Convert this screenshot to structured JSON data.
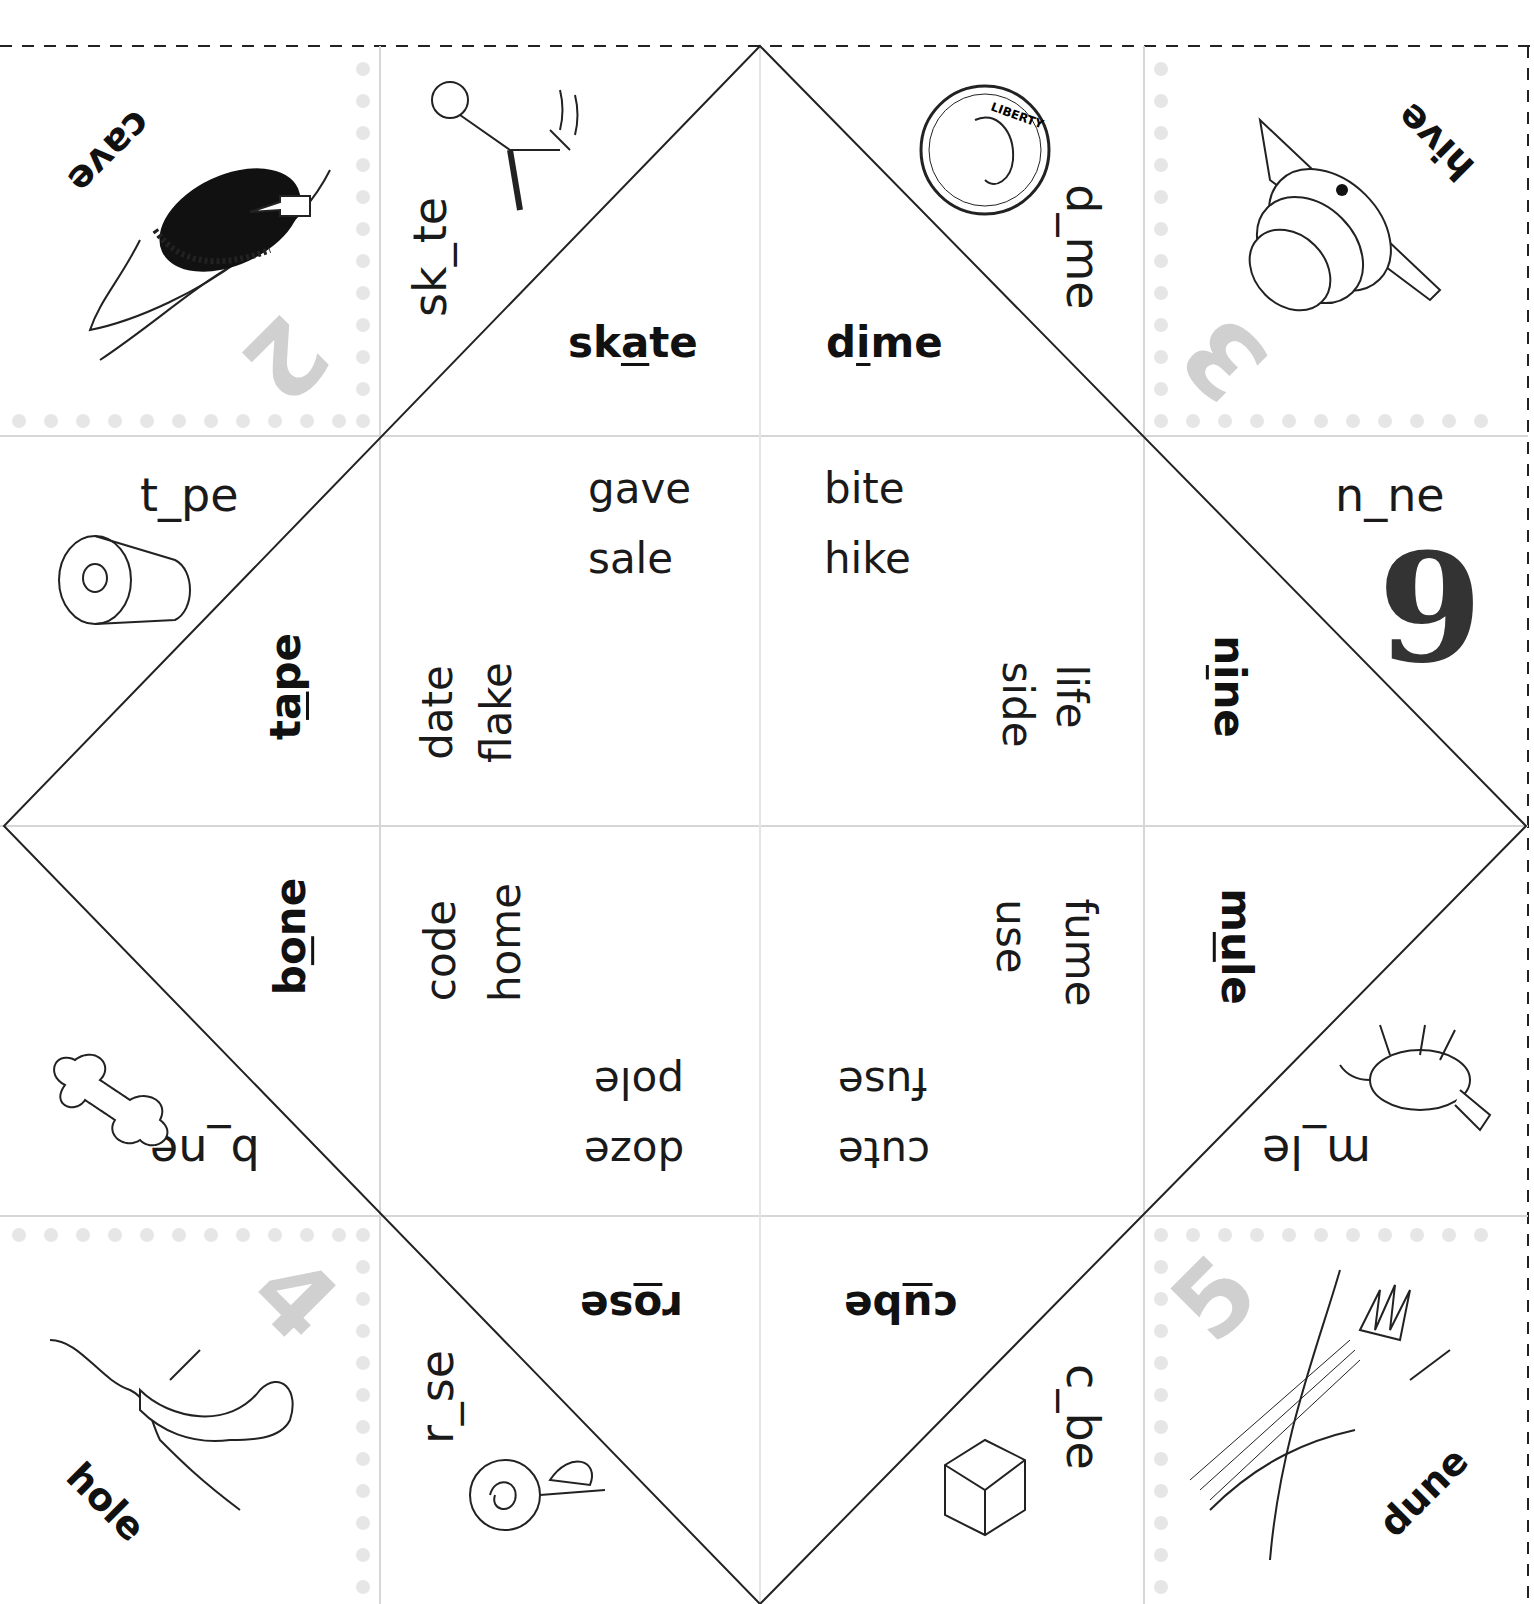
{
  "corners": [
    {
      "position": "top-left",
      "number": "2",
      "label": "cave",
      "picture": "cave-illustration"
    },
    {
      "position": "top-right",
      "number": "3",
      "label": "hive",
      "picture": "beehive-illustration"
    },
    {
      "position": "bottom-left",
      "number": "4",
      "label": "hole",
      "picture": "worm-hole-illustration"
    },
    {
      "position": "bottom-right",
      "number": "5",
      "label": "dune",
      "picture": "sand-dune-illustration"
    }
  ],
  "outer_flaps": [
    {
      "position": "top-left-upper",
      "fill": "sk_te",
      "picture": "skater-illustration"
    },
    {
      "position": "top-right-upper",
      "fill": "d_me",
      "picture": "dime-coin-illustration"
    },
    {
      "position": "left-upper",
      "fill": "t_pe",
      "picture": "tape-dispenser-illustration"
    },
    {
      "position": "right-upper",
      "fill": "n_ne",
      "picture": "number-9"
    },
    {
      "position": "left-lower",
      "fill": "b_ne",
      "picture": "bone-illustration"
    },
    {
      "position": "right-lower",
      "fill": "m_le",
      "picture": "mule-illustration"
    },
    {
      "position": "bottom-left-lower",
      "fill": "r_se",
      "picture": "rose-illustration"
    },
    {
      "position": "bottom-right-lower",
      "fill": "c_be",
      "picture": "sugar-cube-illustration"
    }
  ],
  "coin": {
    "text": "LIBERTY",
    "year": "2000",
    "motto": "IN GOD WE TRUST"
  },
  "nine_digit": "9",
  "answer_words": [
    {
      "word": "skate",
      "vowel": "a",
      "prefix": "sk",
      "suffix": "te"
    },
    {
      "word": "dime",
      "vowel": "i",
      "prefix": "d",
      "suffix": "me"
    },
    {
      "word": "tape",
      "vowel": "a",
      "prefix": "t",
      "suffix": "pe"
    },
    {
      "word": "nine",
      "vowel": "i",
      "prefix": "n",
      "suffix": "ne"
    },
    {
      "word": "bone",
      "vowel": "o",
      "prefix": "b",
      "suffix": "ne"
    },
    {
      "word": "mule",
      "vowel": "u",
      "prefix": "m",
      "suffix": "le"
    },
    {
      "word": "rose",
      "vowel": "o",
      "prefix": "r",
      "suffix": "se"
    },
    {
      "word": "cube",
      "vowel": "u",
      "prefix": "c",
      "suffix": "be"
    }
  ],
  "inner_words": {
    "top_left": [
      "gave",
      "sale"
    ],
    "top_right": [
      "bite",
      "hike"
    ],
    "left_upper": [
      "date",
      "flake"
    ],
    "right_upper": [
      "life",
      "side"
    ],
    "left_lower": [
      "code",
      "home"
    ],
    "right_lower": [
      "fume",
      "use"
    ],
    "bottom_left": [
      "pole",
      "doze"
    ],
    "bottom_right": [
      "fuse",
      "cute"
    ]
  }
}
